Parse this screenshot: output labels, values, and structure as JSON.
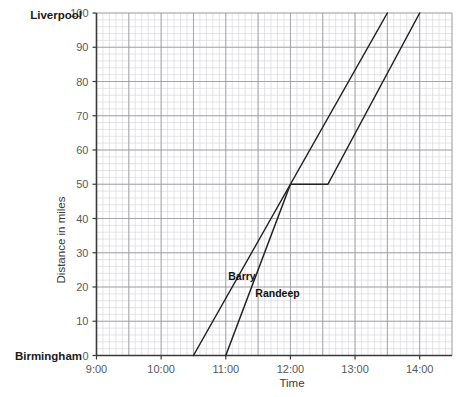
{
  "chart_data": {
    "type": "line",
    "title": "",
    "xlabel": "Time",
    "ylabel": "Distance in miles",
    "endpoint_labels": {
      "top": "Liverpool",
      "bottom": "Birmingham"
    },
    "x_ticks": [
      "9:00",
      "10:00",
      "11:00",
      "12:00",
      "13:00",
      "14:00"
    ],
    "x_tick_hours": [
      9,
      10,
      11,
      12,
      13,
      14
    ],
    "xlim": [
      9,
      14.5
    ],
    "y_ticks": [
      0,
      10,
      20,
      30,
      40,
      50,
      60,
      70,
      80,
      90,
      100
    ],
    "ylim": [
      0,
      100
    ],
    "grid": true,
    "grid_minor_per_major": 5,
    "legend": "inline-annotations",
    "series": [
      {
        "name": "Barry",
        "color": "#222222",
        "label_x_hour": 11.25,
        "label_y_miles": 22,
        "points": [
          {
            "time": "10:30",
            "x": 10.5,
            "y": 0
          },
          {
            "time": "13:30",
            "x": 13.5,
            "y": 100
          }
        ]
      },
      {
        "name": "Randeep",
        "color": "#222222",
        "label_x_hour": 11.8,
        "label_y_miles": 17,
        "points": [
          {
            "time": "11:00",
            "x": 11.0,
            "y": 0
          },
          {
            "time": "12:00",
            "x": 12.0,
            "y": 50
          },
          {
            "time": "12:35",
            "x": 12.58,
            "y": 50
          },
          {
            "time": "14:00",
            "x": 14.0,
            "y": 100
          }
        ]
      }
    ]
  },
  "colors": {
    "line": "#222222",
    "grid_minor": "#d9d9dc",
    "grid_major": "#9a9a9e",
    "axis": "#3a3a3a",
    "tick_text": "#58595b",
    "city_text": "#1a1a1a"
  }
}
